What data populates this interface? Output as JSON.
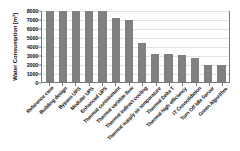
{
  "chart_data": {
    "type": "bar",
    "title": "",
    "xlabel": "",
    "ylabel": "Water Consumption [m³]",
    "ylim": [
      0,
      8000
    ],
    "ytick_labels": [
      "8000",
      "7000",
      "6000",
      "5000",
      "4000",
      "3000",
      "2000",
      "1000",
      "0"
    ],
    "ytick_values": [
      8000,
      7000,
      6000,
      5000,
      4000,
      3000,
      2000,
      1000,
      0
    ],
    "grid": true,
    "legend": "none",
    "bar_color": "#808080",
    "categories": [
      "Reference case",
      "Building design",
      "Bypass UPS",
      "Modular UPS",
      "Enhanced UPS",
      "Thermal containment",
      "Thermal variable flow",
      "Thermal indirect cooling",
      "Thermal supply air temperature",
      "Thermal Delta T",
      "Thermal high efficiency",
      "IT Consolidation",
      "Turn Off Idle Server",
      "Green Algorithm"
    ],
    "values": [
      7900,
      7900,
      7900,
      7900,
      7900,
      7100,
      6900,
      4350,
      3100,
      3100,
      2950,
      2650,
      1900,
      1900
    ]
  }
}
